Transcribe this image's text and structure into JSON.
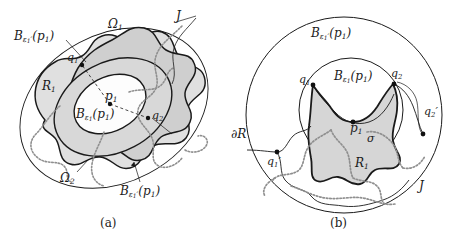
{
  "figure": {
    "background_color": "#ffffff",
    "ink_color": "#1a1a1a",
    "fill_light": "#e3e3e3",
    "fill_mid": "#d2d2d2",
    "fill_white": "#ffffff",
    "dotted_curve_color": "#8c8c8c"
  },
  "panels": [
    {
      "id": "a",
      "caption": "(a)",
      "labels": {
        "outer_ball": "B",
        "outer_ball_sub": "ε",
        "outer_ball_sub_idx": "1",
        "outer_ball_prime": "′",
        "outer_ball_arg": "(p",
        "outer_ball_arg_idx": "1",
        "outer_ball_close": ")",
        "omega_1": "Ω",
        "omega_1_sub": "1",
        "omega_2": "Ω",
        "omega_2_sub": "2",
        "region_R1": "R",
        "region_R1_sub": "1",
        "point_p1": "p",
        "point_p1_sub": "1",
        "inner_ball": "B",
        "inner_ball_sub": "ε",
        "inner_ball_sub_idx": "1",
        "q1": "q",
        "q1_sub": "1",
        "q2": "q",
        "q2_sub": "2",
        "curve_J": "J"
      }
    },
    {
      "id": "b",
      "caption": "(b)",
      "labels": {
        "outer_ball": "B",
        "inner_ball": "B",
        "boundary_R": "∂R",
        "sigma": "σ",
        "region_R1": "R",
        "point_p1": "p",
        "q1": "q",
        "q2": "q",
        "q1_prime": "q",
        "q2_prime": "q",
        "curve_J": "J"
      }
    }
  ],
  "labels_a": {
    "outer_ball_full": "B<sub>ε<sub>1</sub>′</sub>(p<sub>1</sub>)",
    "omega1": "Ω",
    "omega1_sub": "1",
    "omega2": "Ω",
    "omega2_sub": "2",
    "R1": "R",
    "R1_sub": "1",
    "p1": "p",
    "p1_sub": "1",
    "q1": "q",
    "q1_sub": "1",
    "q2": "q",
    "q2_sub": "2",
    "J": "J",
    "B": "B",
    "eps": "ε",
    "one": "1",
    "prime": "′",
    "open_p": "(p",
    "close_p": ")",
    "caption": "(a)"
  },
  "labels_b": {
    "B": "B",
    "eps": "ε",
    "one": "1",
    "two": "2",
    "prime": "′",
    "open_p": "(p",
    "close_p": ")",
    "dR": "∂R",
    "sigma": "σ",
    "R1": "R",
    "p1": "p",
    "q1": "q",
    "q2": "q",
    "J": "J",
    "caption": "(b)"
  }
}
